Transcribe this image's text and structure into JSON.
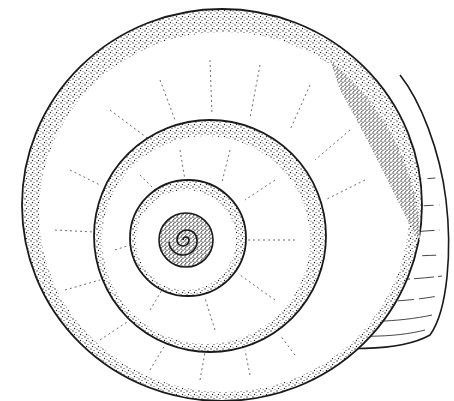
{
  "figure": {
    "colors": {
      "background": "#ffffff",
      "ink": "#1a1a1a",
      "stipple": "#2a2a2a"
    },
    "whorls": [
      {
        "name": "body-whorl",
        "cx": 222,
        "cy": 205,
        "rx": 200,
        "ry": 196
      },
      {
        "name": "second-whorl",
        "cx": 210,
        "cy": 236,
        "r": 116
      },
      {
        "name": "third-whorl",
        "cx": 188,
        "cy": 238,
        "r": 58
      },
      {
        "name": "apex-whorl",
        "cx": 186,
        "cy": 240,
        "r": 27
      }
    ],
    "aperture": {
      "right_edge_x": 450,
      "bottom_y": 350
    }
  }
}
